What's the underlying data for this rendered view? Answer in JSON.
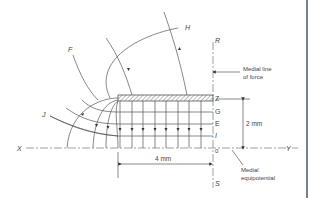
{
  "figure": {
    "type": "electric field diagram",
    "colors": {
      "line": "#555555",
      "text": "#444444",
      "frame": "#6f8596",
      "hatch": "#777777"
    },
    "labels": {
      "F": "F",
      "H": "H",
      "J": "J",
      "R": "R",
      "S": "S",
      "X": "X",
      "Y": "Y",
      "Z": "Z",
      "G": "G",
      "E": "E",
      "I": "I",
      "O": "0"
    },
    "annotations": {
      "medial_line_1": "Medial line",
      "medial_line_2": "of force",
      "medial_equi_1": "Medial",
      "medial_equi_2": "equipotential",
      "dim_vertical": "2 mm",
      "dim_horizontal": "4 mm"
    }
  }
}
